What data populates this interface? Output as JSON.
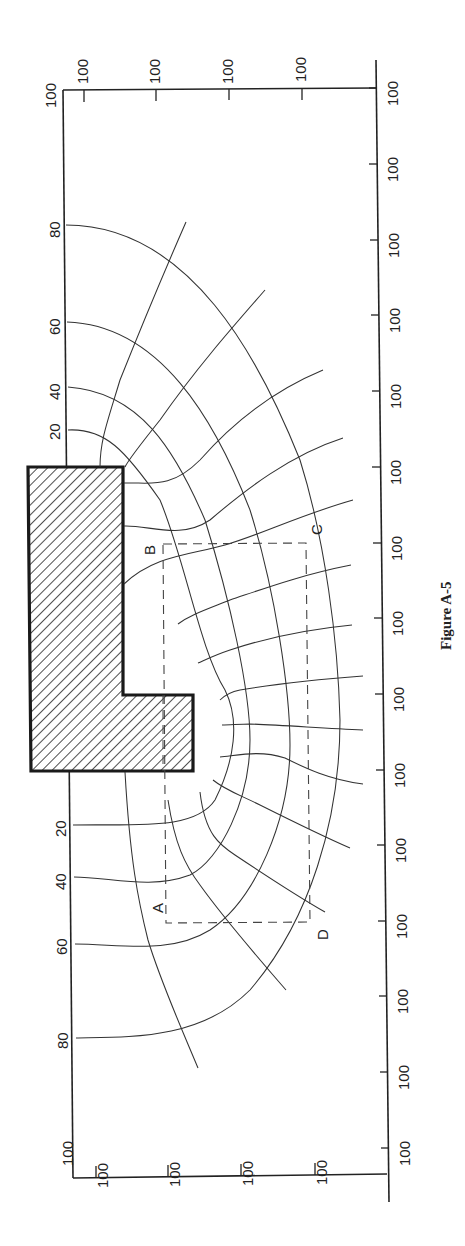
{
  "figure": {
    "caption": "Figure A-5",
    "orientation": "rotated 90 degrees clockwise (page scanned sideways)"
  },
  "axes": {
    "top_edge_corner_labels": [
      "100",
      "100"
    ],
    "top_edge_tick_labels": [
      "100",
      "100",
      "100",
      "100"
    ],
    "bottom_edge_corner_labels": [
      "100",
      "100"
    ],
    "bottom_edge_tick_labels": [
      "100",
      "100",
      "100",
      "100"
    ],
    "right_edge_tick_labels": [
      "100",
      "100",
      "100",
      "100",
      "100",
      "100",
      "100",
      "100",
      "100",
      "100",
      "100",
      "100",
      "100",
      "100",
      "100"
    ]
  },
  "depth_labels": {
    "upper": [
      "20",
      "40",
      "60",
      "80"
    ],
    "lower": [
      "20",
      "40",
      "60",
      "80"
    ]
  },
  "points": {
    "A": "A",
    "B": "B",
    "C": "C",
    "D": "D"
  },
  "colors": {
    "line": "#333333",
    "background": "#ffffff",
    "structure_hatch": "#222222"
  }
}
